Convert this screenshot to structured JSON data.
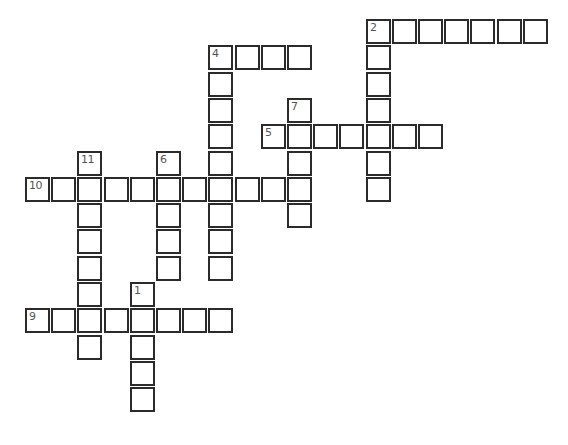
{
  "puzzle": {
    "words": [
      {
        "number": "1",
        "direction": "down",
        "start": [
          10,
          4
        ],
        "length": 5
      },
      {
        "number": "2",
        "direction": "across",
        "start": [
          0,
          13
        ],
        "length": 7
      },
      {
        "number": "2",
        "direction": "down",
        "start": [
          0,
          13
        ],
        "length": 7
      },
      {
        "number": "4",
        "direction": "across",
        "start": [
          1,
          7
        ],
        "length": 4
      },
      {
        "number": "4",
        "direction": "down",
        "start": [
          1,
          7
        ],
        "length": 9
      },
      {
        "number": "5",
        "direction": "across",
        "start": [
          4,
          9
        ],
        "length": 7
      },
      {
        "number": "6",
        "direction": "down",
        "start": [
          5,
          5
        ],
        "length": 5
      },
      {
        "number": "7",
        "direction": "down",
        "start": [
          3,
          10
        ],
        "length": 5
      },
      {
        "number": "9",
        "direction": "across",
        "start": [
          11,
          0
        ],
        "length": 8
      },
      {
        "number": "10",
        "direction": "across",
        "start": [
          6,
          0
        ],
        "length": 11
      },
      {
        "number": "11",
        "direction": "down",
        "start": [
          5,
          2
        ],
        "length": 8
      }
    ],
    "cell_values": {}
  },
  "colors": {
    "border": "#2b2b2b",
    "number": "#555555",
    "background": "#ffffff"
  }
}
